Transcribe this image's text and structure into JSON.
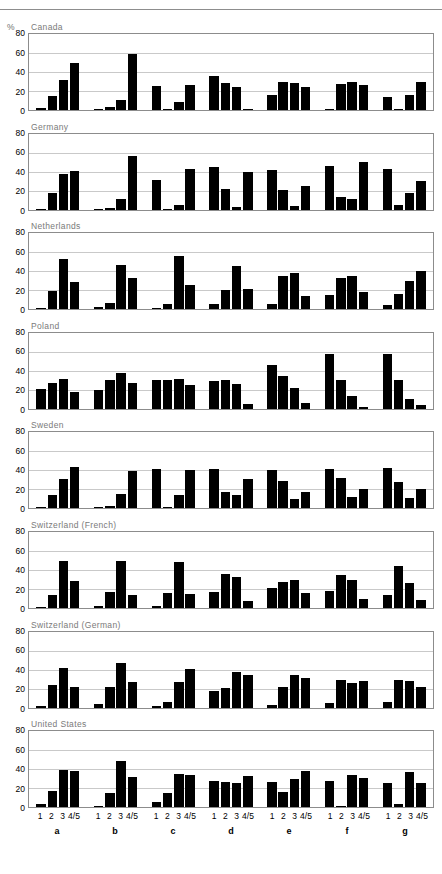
{
  "figure": {
    "clipped_header": "",
    "unit_label": "%",
    "y_ticks": [
      0,
      20,
      40,
      60,
      80
    ],
    "y_max": 80,
    "category_labels": [
      "1",
      "2",
      "3",
      "4/5"
    ],
    "group_labels": [
      "a",
      "b",
      "c",
      "d",
      "e",
      "f",
      "g"
    ],
    "bar_color": "#000000",
    "grid_color": "#c9c9c9",
    "frame_color": "#8c8c8c",
    "title_color": "#7a7a7a"
  },
  "chart_data": {
    "type": "bar",
    "title": "",
    "xlabel": "",
    "ylabel": "%",
    "ylim": [
      0,
      80
    ],
    "grid": true,
    "legend": "none",
    "categories": [
      "a-1",
      "a-2",
      "a-3",
      "a-4/5",
      "b-1",
      "b-2",
      "b-3",
      "b-4/5",
      "c-1",
      "c-2",
      "c-3",
      "c-4/5",
      "d-1",
      "d-2",
      "d-3",
      "d-4/5",
      "e-1",
      "e-2",
      "e-3",
      "e-4/5",
      "f-1",
      "f-2",
      "f-3",
      "f-4/5",
      "g-1",
      "g-2",
      "g-3",
      "g-4/5"
    ],
    "panels": [
      {
        "name": "Canada",
        "values": [
          2,
          15,
          32,
          50,
          1,
          3,
          11,
          59,
          25,
          1,
          8,
          26,
          36,
          28,
          24,
          1,
          16,
          29,
          28,
          24,
          1,
          27,
          30,
          26,
          14,
          1,
          16,
          30
        ]
      },
      {
        "name": "Germany",
        "values": [
          1,
          17,
          37,
          41,
          1,
          2,
          11,
          56,
          31,
          1,
          5,
          43,
          45,
          22,
          3,
          40,
          42,
          21,
          4,
          25,
          46,
          13,
          11,
          50,
          43,
          5,
          17,
          30
        ]
      },
      {
        "name": "Netherlands",
        "values": [
          1,
          19,
          53,
          29,
          2,
          7,
          47,
          33,
          1,
          5,
          56,
          25,
          6,
          20,
          46,
          21,
          5,
          35,
          38,
          14,
          15,
          33,
          35,
          18,
          4,
          16,
          30,
          40
        ]
      },
      {
        "name": "Poland",
        "values": [
          21,
          27,
          31,
          18,
          20,
          30,
          38,
          27,
          30,
          30,
          31,
          25,
          29,
          30,
          26,
          5,
          46,
          35,
          22,
          6,
          58,
          30,
          13,
          2,
          58,
          30,
          10,
          4
        ]
      },
      {
        "name": "Sweden",
        "values": [
          1,
          14,
          31,
          44,
          1,
          3,
          15,
          39,
          41,
          1,
          14,
          40,
          41,
          17,
          14,
          31,
          40,
          29,
          10,
          17,
          42,
          32,
          12,
          20,
          43,
          28,
          11,
          20
        ]
      },
      {
        "name": "Switzerland (French)",
        "values": [
          1,
          14,
          50,
          28,
          2,
          17,
          49,
          14,
          2,
          16,
          48,
          15,
          17,
          36,
          33,
          7,
          21,
          27,
          29,
          16,
          18,
          35,
          30,
          10,
          14,
          44,
          26,
          8
        ]
      },
      {
        "name": "Switzerland (German)",
        "values": [
          2,
          24,
          42,
          22,
          4,
          22,
          47,
          27,
          2,
          6,
          27,
          41,
          18,
          21,
          37,
          34,
          3,
          22,
          34,
          31,
          5,
          29,
          26,
          28,
          6,
          29,
          28,
          22
        ]
      },
      {
        "name": "United States",
        "values": [
          3,
          17,
          39,
          38,
          1,
          15,
          49,
          32,
          5,
          15,
          35,
          34,
          28,
          27,
          25,
          33,
          27,
          16,
          30,
          38,
          28,
          1,
          34,
          31,
          26,
          3,
          37,
          26
        ]
      }
    ]
  }
}
